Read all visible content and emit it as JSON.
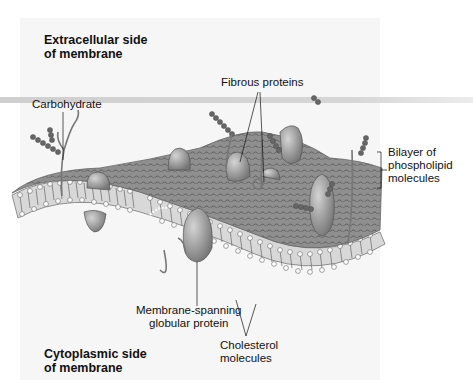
{
  "labels": {
    "extracellular_line1": "Extracellular side",
    "extracellular_line2": "of membrane",
    "cytoplasmic_line1": "Cytoplasmic side",
    "cytoplasmic_line2": "of membrane",
    "carbohydrate": "Carbohydrate",
    "fibrous_proteins": "Fibrous proteins",
    "bilayer_line1": "Bilayer of",
    "bilayer_line2": "phospholipid",
    "bilayer_line3": "molecules",
    "globular_line1": "Membrane-spanning",
    "globular_line2": "globular protein",
    "cholesterol_line1": "Cholesterol",
    "cholesterol_line2": "molecules"
  },
  "colors": {
    "panel": "#f6f6f6",
    "membrane_surface": "#9a9a9a",
    "protein": "#a8a8a8",
    "carbohydrate_bead": "#6a6a6a",
    "lipid_head": "#ffffff"
  }
}
